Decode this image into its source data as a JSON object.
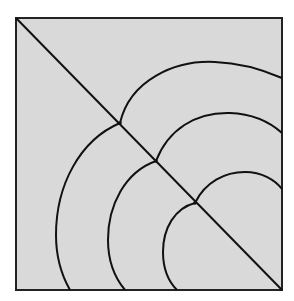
{
  "figure": {
    "colors": {
      "background": "#ffffff",
      "square_fill": "#d8d8d8",
      "stroke": "#111111"
    },
    "square": {
      "x": 16,
      "y": 18,
      "width": 266,
      "height": 272
    },
    "diagonal": {
      "x1": 16,
      "y1": 18,
      "x2": 282,
      "y2": 290
    },
    "junctions": [
      {
        "x": 120,
        "y": 123
      },
      {
        "x": 156,
        "y": 161
      },
      {
        "x": 195,
        "y": 203
      }
    ],
    "upper_arcs": [
      {
        "name": "outer",
        "d": "M120,123 C130,80 175,60 215,62 C245,63 268,72 282,78"
      },
      {
        "name": "middle",
        "d": "M156,161 C168,130 195,112 230,113 C255,114 272,124 282,133"
      },
      {
        "name": "inner",
        "d": "M195,203 C205,182 225,172 245,172 C262,172 275,180 282,189"
      }
    ],
    "lower_arcs": [
      {
        "name": "outer",
        "d": "M120,123 C80,140 56,185 56,235 C56,258 62,276 70,290"
      },
      {
        "name": "middle",
        "d": "M156,161 C125,172 108,205 108,240 C108,262 115,278 125,290"
      },
      {
        "name": "inner",
        "d": "M195,203 C175,208 163,228 163,252 C163,268 168,281 177,290"
      }
    ]
  }
}
